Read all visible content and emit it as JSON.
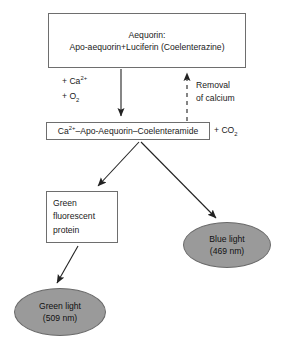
{
  "diagram": {
    "background_color": "#ffffff",
    "line_color": "#333333",
    "box_border_color": "#6e6e6e",
    "ellipse_fill_color": "#9a9a9a"
  },
  "nodes": {
    "aequorin_box": {
      "line1": "Aequorin:",
      "line2_prefix": "Apo-aequorin",
      "line2_plus": "+",
      "line2_suffix": "Luciferin (Coelenterazine)",
      "shape": "rectangle"
    },
    "complex_box": {
      "ca": "Ca",
      "ca_sup": "2+",
      "rest": "–Apo-Aequorin–Coelenteramide",
      "shape": "rectangle"
    },
    "co2_label": {
      "plus": "+ CO",
      "sub": "2"
    },
    "gfp_box": {
      "line1": "Green",
      "line2": "fluorescent",
      "line3": "protein",
      "shape": "rectangle"
    },
    "blue_light": {
      "line1": "Blue light",
      "line2": "(469 nm)",
      "shape": "ellipse",
      "fill": "#9a9a9a"
    },
    "green_light": {
      "line1": "Green light",
      "line2": "(509 nm)",
      "shape": "ellipse",
      "fill": "#9a9a9a"
    }
  },
  "edge_labels": {
    "reactants": {
      "line1_plus": "+ Ca",
      "line1_sup": "2+",
      "line2_plus": "+ O",
      "line2_sub": "2"
    },
    "removal": {
      "line1": "Removal",
      "line2": "of calcium"
    }
  },
  "edges": [
    {
      "name": "aequorin-to-complex",
      "style": "solid",
      "direction": "down"
    },
    {
      "name": "complex-to-aequorin",
      "style": "dashed",
      "direction": "up"
    },
    {
      "name": "complex-to-gfp",
      "style": "solid",
      "direction": "down-left"
    },
    {
      "name": "complex-to-blue-light",
      "style": "solid",
      "direction": "down-right"
    },
    {
      "name": "gfp-to-green-light",
      "style": "solid",
      "direction": "down-left"
    }
  ]
}
